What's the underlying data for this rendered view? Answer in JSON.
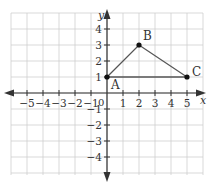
{
  "diagram": {
    "type": "coordinate-plane",
    "axes": {
      "x_label": "x",
      "y_label": "y",
      "origin_label": "0",
      "x_ticks": [
        "-5",
        "-4",
        "-3",
        "-2",
        "-1",
        "1",
        "2",
        "3",
        "4",
        "5"
      ],
      "x_tick_values": [
        -5,
        -4,
        -3,
        -2,
        -1,
        1,
        2,
        3,
        4,
        5
      ],
      "y_ticks": [
        "4",
        "3",
        "2",
        "1",
        "-1",
        "-2",
        "-3",
        "-4"
      ],
      "y_tick_values": [
        4,
        3,
        2,
        1,
        -1,
        -2,
        -3,
        -4
      ],
      "x_range": [
        -6,
        6
      ],
      "y_range": [
        -5,
        5
      ],
      "grid": true
    },
    "points": [
      {
        "label": "A",
        "x": 0,
        "y": 1
      },
      {
        "label": "B",
        "x": 2,
        "y": 3
      },
      {
        "label": "C",
        "x": 5,
        "y": 1
      }
    ],
    "polygon": [
      "A",
      "B",
      "C"
    ],
    "colors": {
      "grid": "#cfcfcf",
      "axis": "#333333",
      "triangle": "#555555",
      "point": "#111111"
    }
  }
}
